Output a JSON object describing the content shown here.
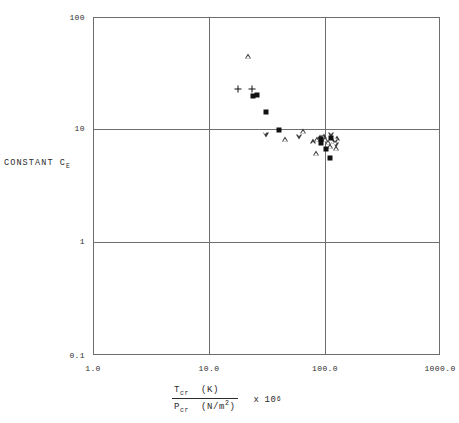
{
  "chart_data": {
    "type": "scatter",
    "title": "",
    "subtitle": "",
    "xlabel": "T_cr (K) / P_cr (N/m^2)  x 10^6",
    "ylabel": "CONSTANT C_E",
    "xscale": "log",
    "yscale": "log",
    "xlim": [
      1.0,
      1000.0
    ],
    "ylim": [
      0.1,
      100
    ],
    "grid": true,
    "legend": "none",
    "xticks": [
      "1.0",
      "10.0",
      "100.0",
      "1000.0"
    ],
    "xtick_values": [
      1.0,
      10.0,
      100.0,
      1000.0
    ],
    "yticks": [
      "0.1",
      "1",
      "10",
      "100"
    ],
    "ytick_values": [
      0.1,
      1,
      10,
      100
    ],
    "series": [
      {
        "name": "triangle-up",
        "marker": "triangle-up",
        "points": [
          {
            "x": 22.0,
            "y": 46.0
          },
          {
            "x": 46.0,
            "y": 8.3
          },
          {
            "x": 66.0,
            "y": 9.8
          },
          {
            "x": 80.0,
            "y": 7.9
          },
          {
            "x": 87.0,
            "y": 8.3
          },
          {
            "x": 92.0,
            "y": 8.6
          },
          {
            "x": 96.0,
            "y": 8.6
          },
          {
            "x": 99.0,
            "y": 8.9
          },
          {
            "x": 103.0,
            "y": 8.3
          },
          {
            "x": 108.0,
            "y": 7.8
          },
          {
            "x": 113.0,
            "y": 7.2
          },
          {
            "x": 121.0,
            "y": 8.0
          },
          {
            "x": 128.0,
            "y": 6.9
          },
          {
            "x": 86.0,
            "y": 6.2
          },
          {
            "x": 131.0,
            "y": 8.4
          }
        ]
      },
      {
        "name": "triangle-down",
        "marker": "triangle-down",
        "points": [
          {
            "x": 31.0,
            "y": 9.0
          },
          {
            "x": 61.0,
            "y": 8.7
          },
          {
            "x": 116.0,
            "y": 9.1
          },
          {
            "x": 124.0,
            "y": 7.8
          },
          {
            "x": 126.0,
            "y": 7.3
          }
        ]
      },
      {
        "name": "filled-square",
        "marker": "square",
        "points": [
          {
            "x": 24.0,
            "y": 20.0
          },
          {
            "x": 26.0,
            "y": 20.5
          },
          {
            "x": 31.0,
            "y": 14.5
          },
          {
            "x": 41.0,
            "y": 9.9
          },
          {
            "x": 95.0,
            "y": 8.3
          },
          {
            "x": 94.0,
            "y": 7.6
          },
          {
            "x": 114.0,
            "y": 8.4
          },
          {
            "x": 104.0,
            "y": 6.7
          },
          {
            "x": 113.0,
            "y": 5.6
          }
        ]
      },
      {
        "name": "plus",
        "marker": "plus",
        "points": [
          {
            "x": 18.0,
            "y": 23.0
          },
          {
            "x": 23.5,
            "y": 23.0
          }
        ]
      }
    ]
  },
  "axes": {
    "y_title_main": "CONSTANT C",
    "y_title_sub": "E",
    "x_title": {
      "numerator_sym": "T",
      "numerator_sub": "cr",
      "numerator_unit": "(K)",
      "denominator_sym": "P",
      "denominator_sub": "cr",
      "denominator_unit_pre": "(N/m",
      "denominator_unit_sup": "2",
      "denominator_unit_post": ")",
      "multiplier_sym": "x",
      "multiplier_base": "10",
      "multiplier_exp": "6"
    }
  },
  "colors": {
    "axis": "#6e6e6e",
    "marker_fill": "#111111",
    "marker_outline": "#3a3a3a",
    "background": "#ffffff",
    "text": "#2b2b2b"
  }
}
